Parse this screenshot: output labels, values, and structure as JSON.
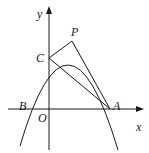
{
  "figure": {
    "labels": {
      "y_axis": "y",
      "x_axis": "x",
      "origin": "O",
      "point_a": "A",
      "point_b": "B",
      "point_c": "C",
      "point_p": "P"
    },
    "colors": {
      "stroke": "#1a1a1a",
      "background": "#ffffff"
    },
    "elements": [
      "x-axis with arrow",
      "y-axis with arrow",
      "downward parabola through B, C, P, A",
      "segment CP",
      "segment PA",
      "segment CA"
    ]
  }
}
